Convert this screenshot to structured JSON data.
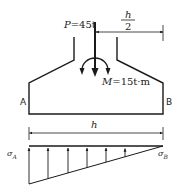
{
  "diagram": {
    "load": {
      "symbol": "P",
      "equals": "=45t"
    },
    "moment": {
      "symbol": "M",
      "equals": "=15t·m"
    },
    "half_width_dim": {
      "numerator": "h",
      "denominator": "2"
    },
    "width_dim": {
      "label": "h"
    },
    "edge_labels": {
      "left": "A",
      "right": "B"
    },
    "pressure": {
      "left": {
        "symbol": "σ",
        "sub": "A"
      },
      "right": {
        "symbol": "σ",
        "sub": "B"
      }
    },
    "colors": {
      "line": "#1a1a1a",
      "text": "#222222",
      "background": "#ffffff"
    }
  }
}
